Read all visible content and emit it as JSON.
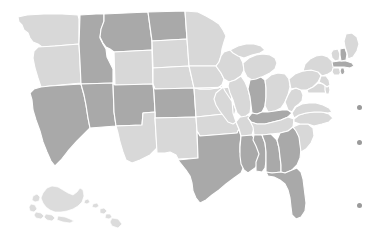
{
  "map": {
    "title": "United States Choropleth Map",
    "projection": "albers-usa",
    "background_color": "#ffffff",
    "border_color": "#ffffff",
    "palette": {
      "dark": "#a9a9a9",
      "light": "#d8d8d8",
      "inset": "#dcdcdc",
      "dot": "#9a9a9a"
    },
    "categories": [
      {
        "key": "dark",
        "label": "Group A",
        "color": "#a9a9a9"
      },
      {
        "key": "light",
        "label": "Group B",
        "color": "#d8d8d8"
      }
    ],
    "states": [
      {
        "code": "WA",
        "name": "Washington",
        "shade": "light",
        "color": "#d8d8d8"
      },
      {
        "code": "OR",
        "name": "Oregon",
        "shade": "light",
        "color": "#d8d8d8"
      },
      {
        "code": "ID",
        "name": "Idaho",
        "shade": "dark",
        "color": "#a9a9a9"
      },
      {
        "code": "MT",
        "name": "Montana",
        "shade": "dark",
        "color": "#a9a9a9"
      },
      {
        "code": "WY",
        "name": "Wyoming",
        "shade": "light",
        "color": "#d8d8d8"
      },
      {
        "code": "ND",
        "name": "North Dakota",
        "shade": "dark",
        "color": "#a9a9a9"
      },
      {
        "code": "SD",
        "name": "South Dakota",
        "shade": "light",
        "color": "#d8d8d8"
      },
      {
        "code": "NE",
        "name": "Nebraska",
        "shade": "light",
        "color": "#d8d8d8"
      },
      {
        "code": "CA",
        "name": "California",
        "shade": "dark",
        "color": "#a9a9a9"
      },
      {
        "code": "NV",
        "name": "Nevada",
        "shade": "dark",
        "color": "#a9a9a9"
      },
      {
        "code": "UT",
        "name": "Utah",
        "shade": "dark",
        "color": "#a9a9a9"
      },
      {
        "code": "CO",
        "name": "Colorado",
        "shade": "dark",
        "color": "#a9a9a9"
      },
      {
        "code": "AZ",
        "name": "Arizona",
        "shade": "light",
        "color": "#d8d8d8"
      },
      {
        "code": "NM",
        "name": "New Mexico",
        "shade": "light",
        "color": "#d8d8d8"
      },
      {
        "code": "KS",
        "name": "Kansas",
        "shade": "light",
        "color": "#d8d8d8"
      },
      {
        "code": "OK",
        "name": "Oklahoma",
        "shade": "light",
        "color": "#d8d8d8"
      },
      {
        "code": "TX",
        "name": "Texas",
        "shade": "dark",
        "color": "#a9a9a9"
      },
      {
        "code": "MN",
        "name": "Minnesota",
        "shade": "light",
        "color": "#d8d8d8"
      },
      {
        "code": "IA",
        "name": "Iowa",
        "shade": "light",
        "color": "#d8d8d8"
      },
      {
        "code": "MO",
        "name": "Missouri",
        "shade": "light",
        "color": "#d8d8d8"
      },
      {
        "code": "AR",
        "name": "Arkansas",
        "shade": "light",
        "color": "#d8d8d8"
      },
      {
        "code": "LA",
        "name": "Louisiana",
        "shade": "dark",
        "color": "#a9a9a9"
      },
      {
        "code": "WI",
        "name": "Wisconsin",
        "shade": "light",
        "color": "#d8d8d8"
      },
      {
        "code": "IL",
        "name": "Illinois",
        "shade": "light",
        "color": "#d8d8d8"
      },
      {
        "code": "MI",
        "name": "Michigan",
        "shade": "light",
        "color": "#d8d8d8"
      },
      {
        "code": "IN",
        "name": "Indiana",
        "shade": "dark",
        "color": "#a9a9a9"
      },
      {
        "code": "OH",
        "name": "Ohio",
        "shade": "light",
        "color": "#d8d8d8"
      },
      {
        "code": "KY",
        "name": "Kentucky",
        "shade": "dark",
        "color": "#a9a9a9"
      },
      {
        "code": "TN",
        "name": "Tennessee",
        "shade": "light",
        "color": "#d8d8d8"
      },
      {
        "code": "MS",
        "name": "Mississippi",
        "shade": "dark",
        "color": "#a9a9a9"
      },
      {
        "code": "AL",
        "name": "Alabama",
        "shade": "dark",
        "color": "#a9a9a9"
      },
      {
        "code": "GA",
        "name": "Georgia",
        "shade": "dark",
        "color": "#a9a9a9"
      },
      {
        "code": "FL",
        "name": "Florida",
        "shade": "dark",
        "color": "#a9a9a9"
      },
      {
        "code": "SC",
        "name": "South Carolina",
        "shade": "light",
        "color": "#d8d8d8"
      },
      {
        "code": "NC",
        "name": "North Carolina",
        "shade": "light",
        "color": "#d8d8d8"
      },
      {
        "code": "VA",
        "name": "Virginia",
        "shade": "light",
        "color": "#d8d8d8"
      },
      {
        "code": "WV",
        "name": "West Virginia",
        "shade": "light",
        "color": "#d8d8d8"
      },
      {
        "code": "PA",
        "name": "Pennsylvania",
        "shade": "light",
        "color": "#d8d8d8"
      },
      {
        "code": "NY",
        "name": "New York",
        "shade": "light",
        "color": "#d8d8d8"
      },
      {
        "code": "MD",
        "name": "Maryland",
        "shade": "light",
        "color": "#d8d8d8"
      },
      {
        "code": "DE",
        "name": "Delaware",
        "shade": "light",
        "color": "#d8d8d8"
      },
      {
        "code": "NJ",
        "name": "New Jersey",
        "shade": "light",
        "color": "#d8d8d8"
      },
      {
        "code": "CT",
        "name": "Connecticut",
        "shade": "light",
        "color": "#d8d8d8"
      },
      {
        "code": "RI",
        "name": "Rhode Island",
        "shade": "dark",
        "color": "#a9a9a9"
      },
      {
        "code": "MA",
        "name": "Massachusetts",
        "shade": "dark",
        "color": "#a9a9a9"
      },
      {
        "code": "VT",
        "name": "Vermont",
        "shade": "light",
        "color": "#d8d8d8"
      },
      {
        "code": "NH",
        "name": "New Hampshire",
        "shade": "dark",
        "color": "#a9a9a9"
      },
      {
        "code": "ME",
        "name": "Maine",
        "shade": "light",
        "color": "#d8d8d8"
      },
      {
        "code": "AK",
        "name": "Alaska",
        "shade": "inset",
        "color": "#dcdcdc"
      },
      {
        "code": "HI",
        "name": "Hawaii",
        "shade": "inset",
        "color": "#dcdcdc"
      }
    ],
    "legend_dots": [
      {
        "id": "dot-1",
        "color": "#9a9a9a",
        "x": 359,
        "y": 107
      },
      {
        "id": "dot-2",
        "color": "#9a9a9a",
        "x": 359,
        "y": 142
      },
      {
        "id": "dot-3",
        "color": "#9a9a9a",
        "x": 359,
        "y": 205
      }
    ]
  }
}
